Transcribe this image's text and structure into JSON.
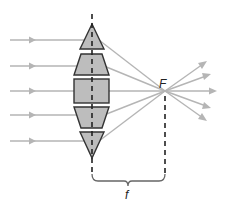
{
  "diagram": {
    "labels": {
      "focal_point": "F",
      "focal_length": "f"
    },
    "colors": {
      "ray": "#b5b5b5",
      "prism_fill": "#bdbdbd",
      "prism_stroke": "#333333",
      "axis": "#222222"
    },
    "incoming_rays_y": [
      40,
      66,
      91,
      115,
      141
    ],
    "lens_axis_x": 92,
    "focal_point": {
      "x": 165,
      "y": 91
    },
    "prisms": [
      {
        "name": "top-triangle",
        "shape": "triangle"
      },
      {
        "name": "upper-trapezoid",
        "shape": "trapezoid"
      },
      {
        "name": "center-rectangle",
        "shape": "rectangle"
      },
      {
        "name": "lower-trapezoid",
        "shape": "trapezoid"
      },
      {
        "name": "bottom-triangle",
        "shape": "triangle"
      }
    ]
  }
}
